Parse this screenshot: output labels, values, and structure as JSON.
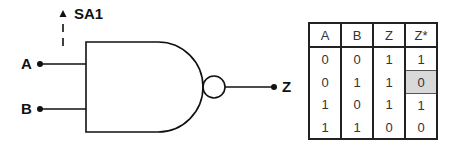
{
  "diagram": {
    "gate_type": "NAND",
    "inputs": [
      {
        "label": "A"
      },
      {
        "label": "B"
      }
    ],
    "output": {
      "label": "Z"
    },
    "fault": {
      "label": "SA1",
      "line": "A"
    }
  },
  "truth_table": {
    "headers": [
      "A",
      "B",
      "Z",
      "Z*"
    ],
    "rows": [
      [
        "0",
        "0",
        "1",
        "1"
      ],
      [
        "0",
        "1",
        "1",
        "0"
      ],
      [
        "1",
        "0",
        "1",
        "1"
      ],
      [
        "1",
        "1",
        "0",
        "0"
      ]
    ],
    "highlight": {
      "row": 1,
      "col": 3,
      "color": "#d9d9d9"
    }
  }
}
